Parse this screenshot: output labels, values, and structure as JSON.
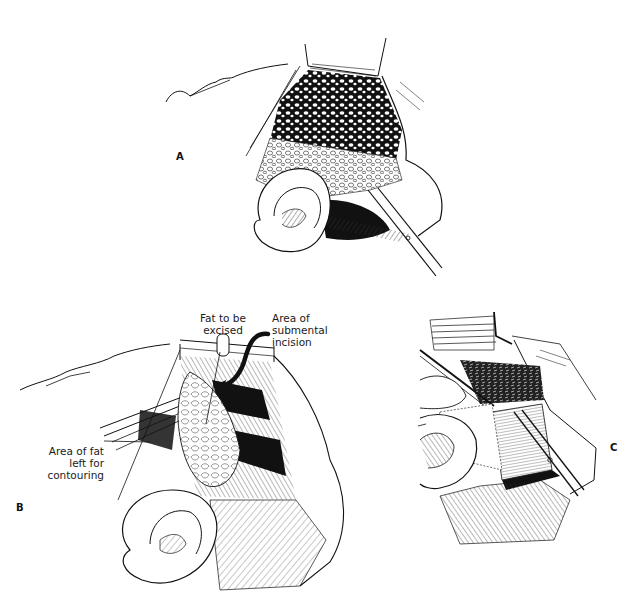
{
  "figure": {
    "panels": [
      {
        "id": "A",
        "letter": "A",
        "description": "Exposed facial fat layer beneath raised skin flap with ear and scissors"
      },
      {
        "id": "B",
        "letter": "B",
        "description": "Fat pad marked for excision with retracted skin flap and submental incision",
        "callouts": [
          {
            "lines": [
              "Fat to be",
              "excised"
            ]
          },
          {
            "lines": [
              "Area of",
              "submental",
              "incision"
            ]
          },
          {
            "lines": [
              "Area of fat",
              "left for",
              "contouring"
            ]
          }
        ]
      },
      {
        "id": "C",
        "letter": "C",
        "description": "Dissection with scissors exposing muscle fibers beside the ear"
      }
    ],
    "colors": {
      "ink": "#111111",
      "background": "#ffffff",
      "hatch": "#333333"
    }
  }
}
